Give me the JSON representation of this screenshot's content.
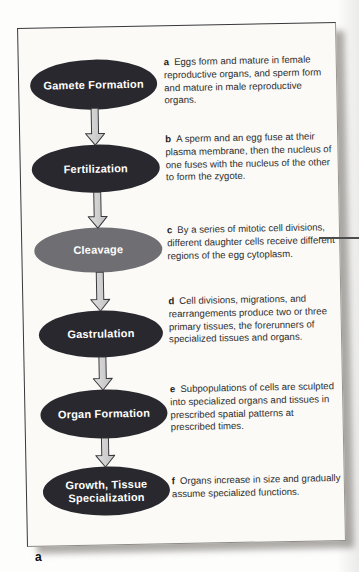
{
  "figure": {
    "label": "a",
    "colors": {
      "stage_dark": "#28282e",
      "stage_highlight": "#6f6e73",
      "arrow_fill": "#d3d3d3",
      "arrow_outline": "#3a3a3e",
      "panel_background": "#fbfaf7",
      "description_text": "#2e2e2e"
    }
  },
  "stages": [
    {
      "name": "Gamete Formation",
      "style": "dark"
    },
    {
      "name": "Fertilization",
      "style": "dark"
    },
    {
      "name": "Cleavage",
      "style": "highlight"
    },
    {
      "name": "Gastrulation",
      "style": "dark"
    },
    {
      "name": "Organ Formation",
      "style": "dark"
    },
    {
      "name": "Growth, Tissue Specialization",
      "style": "dark"
    }
  ],
  "descriptions": [
    {
      "letter": "a",
      "text": "Eggs form and mature in female reproductive organs, and sperm form and mature in male reproductive organs."
    },
    {
      "letter": "b",
      "text": "A sperm and an egg fuse at their plasma membrane, then the nucleus of one fuses with the nucleus of the other to form the zygote."
    },
    {
      "letter": "c",
      "text": "By a series of mitotic cell divisions, different daughter cells receive different regions of the egg cytoplasm."
    },
    {
      "letter": "d",
      "text": "Cell divisions, migrations, and rearrangements produce two or three primary tissues, the forerunners of specialized tissues and organs."
    },
    {
      "letter": "e",
      "text": "Subpopulations of cells are sculpted into specialized organs and tissues in prescribed spatial patterns at prescribed times."
    },
    {
      "letter": "f",
      "text": "Organs increase in size and gradually assume specialized functions."
    }
  ]
}
